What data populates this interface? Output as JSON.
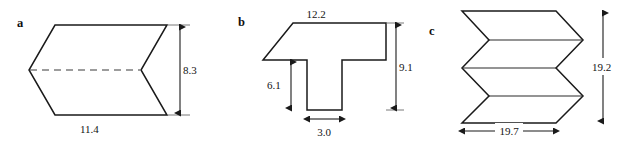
{
  "figure": {
    "kind": "geometry-diagram",
    "background_color": "#ffffff",
    "line_color": "#1a1a1a",
    "panels": [
      {
        "id": "a",
        "label": "a",
        "shape_name": "chevron-arrow-block",
        "dimensions": [
          {
            "name": "height",
            "value": "8.3",
            "orientation": "vertical",
            "position": "right"
          },
          {
            "name": "width",
            "value": "11.4",
            "orientation": "horizontal",
            "position": "bottom"
          }
        ],
        "has_hidden_dashed_line": true
      },
      {
        "id": "b",
        "label": "b",
        "shape_name": "tee-beam-with-tapered-flange",
        "dimensions": [
          {
            "name": "top-width",
            "value": "12.2",
            "orientation": "horizontal",
            "position": "top"
          },
          {
            "name": "total-height",
            "value": "9.1",
            "orientation": "vertical",
            "position": "right"
          },
          {
            "name": "stem-height",
            "value": "6.1",
            "orientation": "vertical",
            "position": "inner-left"
          },
          {
            "name": "stem-width",
            "value": "3.0",
            "orientation": "horizontal",
            "position": "bottom"
          }
        ],
        "has_hidden_dashed_line": false
      },
      {
        "id": "c",
        "label": "c",
        "shape_name": "stacked-chevron-zigzag-block",
        "dimensions": [
          {
            "name": "height",
            "value": "19.2",
            "orientation": "vertical",
            "position": "right"
          },
          {
            "name": "width",
            "value": "19.7",
            "orientation": "horizontal",
            "position": "bottom"
          }
        ],
        "has_hidden_dashed_line": false
      }
    ]
  },
  "labels": {
    "panel_a": "a",
    "panel_b": "b",
    "panel_c": "c",
    "a_height": "8.3",
    "a_width": "11.4",
    "b_top_width": "12.2",
    "b_total_height": "9.1",
    "b_stem_height": "6.1",
    "b_stem_width": "3.0",
    "c_height": "19.2",
    "c_width": "19.7"
  }
}
